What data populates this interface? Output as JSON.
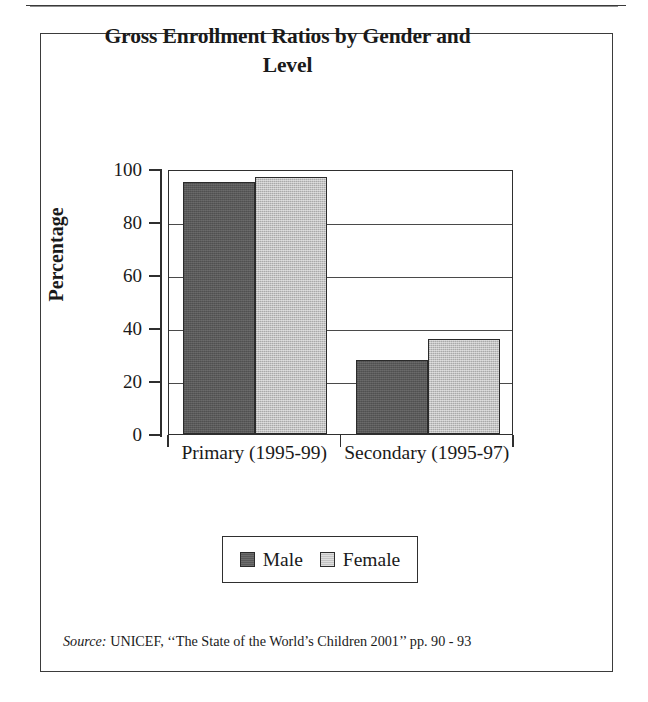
{
  "figure": {
    "title": "Gross Enrollment Ratios by Gender and Level",
    "title_line1": "Gross Enrollment Ratios by Gender and",
    "title_line2": "Level",
    "source_label": "Source:",
    "source_text": "UNICEF, ‘‘The State of the World’s Children 2001’’ pp. 90 - 93",
    "frame_color": "#3b3b3b"
  },
  "legend": {
    "position": "bottom-center",
    "entries": [
      {
        "label": "Male",
        "color": "#595959"
      },
      {
        "label": "Female",
        "color": "#c2c2c2"
      }
    ]
  },
  "chart_data": {
    "type": "bar",
    "title": "Gross Enrollment Ratios by Gender and Level",
    "xlabel": "",
    "ylabel": "Percentage",
    "categories": [
      "Primary (1995-99)",
      "Secondary (1995-97)"
    ],
    "series": [
      {
        "name": "Male",
        "color": "#595959",
        "values": [
          95,
          28
        ]
      },
      {
        "name": "Female",
        "color": "#c2c2c2",
        "values": [
          97,
          36
        ]
      }
    ],
    "ylim": [
      0,
      100
    ],
    "yticks": [
      0,
      20,
      40,
      60,
      80,
      100
    ],
    "ytick_labels": [
      "0",
      "20",
      "40",
      "60",
      "80",
      "100"
    ],
    "grid": true,
    "grid_axis": "y",
    "legend": true,
    "legend_position": "bottom-center"
  }
}
